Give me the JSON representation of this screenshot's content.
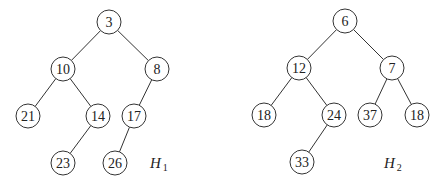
{
  "diagram": {
    "type": "binary-heap-trees",
    "node_radius": 12,
    "trees": [
      {
        "id": "H1",
        "label": "H",
        "label_sub": "1",
        "label_pos": [
          150,
          168
        ],
        "nodes": [
          {
            "id": "a0",
            "value": "3",
            "x": 109,
            "y": 22
          },
          {
            "id": "a1",
            "value": "10",
            "x": 63,
            "y": 69
          },
          {
            "id": "a2",
            "value": "8",
            "x": 157,
            "y": 69
          },
          {
            "id": "a3",
            "value": "21",
            "x": 28,
            "y": 116
          },
          {
            "id": "a4",
            "value": "14",
            "x": 98,
            "y": 116
          },
          {
            "id": "a5",
            "value": "17",
            "x": 134,
            "y": 116
          },
          {
            "id": "a6",
            "value": "23",
            "x": 63,
            "y": 163
          },
          {
            "id": "a7",
            "value": "26",
            "x": 115,
            "y": 163
          }
        ],
        "edges": [
          [
            "a0",
            "a1"
          ],
          [
            "a0",
            "a2"
          ],
          [
            "a1",
            "a3"
          ],
          [
            "a1",
            "a4"
          ],
          [
            "a2",
            "a5"
          ],
          [
            "a4",
            "a6"
          ],
          [
            "a5",
            "a7"
          ]
        ]
      },
      {
        "id": "H2",
        "label": "H",
        "label_sub": "2",
        "label_pos": [
          384,
          168
        ],
        "nodes": [
          {
            "id": "b0",
            "value": "6",
            "x": 345,
            "y": 21
          },
          {
            "id": "b1",
            "value": "12",
            "x": 299,
            "y": 68
          },
          {
            "id": "b2",
            "value": "7",
            "x": 392,
            "y": 68
          },
          {
            "id": "b3",
            "value": "18",
            "x": 264,
            "y": 115
          },
          {
            "id": "b4",
            "value": "24",
            "x": 334,
            "y": 115
          },
          {
            "id": "b5",
            "value": "37",
            "x": 370,
            "y": 115
          },
          {
            "id": "b6",
            "value": "18",
            "x": 417,
            "y": 115
          },
          {
            "id": "b7",
            "value": "33",
            "x": 302,
            "y": 162
          }
        ],
        "edges": [
          [
            "b0",
            "b1"
          ],
          [
            "b0",
            "b2"
          ],
          [
            "b1",
            "b3"
          ],
          [
            "b1",
            "b4"
          ],
          [
            "b2",
            "b5"
          ],
          [
            "b2",
            "b6"
          ],
          [
            "b4",
            "b7"
          ]
        ]
      }
    ]
  }
}
